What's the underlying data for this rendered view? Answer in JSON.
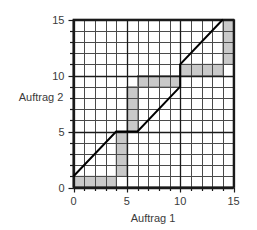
{
  "chart_data": {
    "type": "area",
    "title": "",
    "xlabel": "Auftrag 1",
    "ylabel": "Auftrag 2",
    "xlim": [
      0,
      15
    ],
    "ylim": [
      0,
      15
    ],
    "grid": true,
    "grid_step": 1,
    "legend": "none",
    "xticks": [
      0,
      5,
      10,
      15
    ],
    "xtick_labels": [
      "0",
      "5",
      "10",
      "15"
    ],
    "yticks": [
      0,
      5,
      10,
      15
    ],
    "ytick_labels": [
      "0",
      "5",
      "10",
      "15"
    ],
    "minor_tick_step": 1,
    "series": [
      {
        "name": "schedule-path",
        "type": "line",
        "color": "#000000",
        "width": 2,
        "points": [
          [
            0,
            1
          ],
          [
            4,
            5
          ],
          [
            6,
            5
          ],
          [
            10,
            9
          ],
          [
            10,
            11
          ],
          [
            14,
            15
          ]
        ]
      },
      {
        "name": "blocked-regions",
        "type": "rects",
        "color": "#c9c9c9",
        "stroke": "#8c8c8c",
        "rects": [
          {
            "x0": 0,
            "y0": 0,
            "x1": 4,
            "y1": 1
          },
          {
            "x0": 4,
            "y0": 1,
            "x1": 5,
            "y1": 5
          },
          {
            "x0": 5,
            "y0": 5,
            "x1": 6,
            "y1": 9
          },
          {
            "x0": 6,
            "y0": 9,
            "x1": 10,
            "y1": 10
          },
          {
            "x0": 10,
            "y0": 10,
            "x1": 14,
            "y1": 11
          },
          {
            "x0": 14,
            "y0": 11,
            "x1": 15,
            "y1": 15
          }
        ]
      }
    ]
  },
  "axes": {
    "x_title": "Auftrag 1",
    "y_title": "Auftrag 2",
    "x_tick_labels": [
      "0",
      "5",
      "10",
      "15"
    ],
    "y_tick_labels": [
      "0",
      "5",
      "10",
      "15"
    ]
  },
  "colors": {
    "grid": "#4a4a4a",
    "axis": "#1a1a1a",
    "block_fill": "#c9c9c9",
    "block_stroke": "#8f8f8f",
    "line": "#000000",
    "text": "#3b3b3b",
    "background": "#ffffff"
  }
}
